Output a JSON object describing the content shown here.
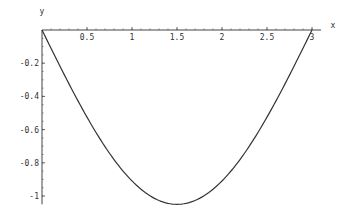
{
  "chart_data": {
    "type": "line",
    "title": "",
    "xlabel": "x",
    "ylabel": "y",
    "xlim": [
      0,
      3.1
    ],
    "ylim": [
      -1.05,
      0
    ],
    "x_ticks": [
      0.5,
      1,
      1.5,
      2,
      2.5,
      3
    ],
    "x_tick_labels": [
      "0.5",
      "1",
      "1.5",
      "2",
      "2.5",
      "3"
    ],
    "y_ticks": [
      -0.2,
      -0.4,
      -0.6,
      -0.8,
      -1
    ],
    "y_tick_labels": [
      "-0.2",
      "-0.4",
      "-0.6",
      "-0.8",
      "-1"
    ],
    "grid": false,
    "legend": null,
    "series": [
      {
        "name": "curve",
        "x": [
          0,
          0.25,
          0.5,
          0.75,
          1,
          1.25,
          1.5,
          1.75,
          2,
          2.25,
          2.5,
          2.75,
          3
        ],
        "y": [
          0,
          -0.27,
          -0.52,
          -0.74,
          -0.91,
          -1.01,
          -1.05,
          -1.01,
          -0.91,
          -0.74,
          -0.52,
          -0.27,
          0
        ],
        "color": "#333333"
      }
    ]
  }
}
